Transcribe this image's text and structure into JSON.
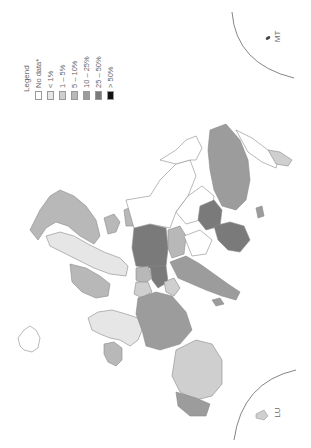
{
  "map": {
    "orientation": "rotated 90° clockwise",
    "region": "Europe",
    "legend": {
      "title": "Legend",
      "items": [
        {
          "label": "No data*",
          "color": "#ffffff"
        },
        {
          "label": "< 1%",
          "color": "#e6e6e6"
        },
        {
          "label": "1 – 5%",
          "color": "#cfcfcf"
        },
        {
          "label": "5 – 10%",
          "color": "#b8b8b8"
        },
        {
          "label": "10 – 25%",
          "color": "#9c9c9c"
        },
        {
          "label": "25 – 50%",
          "color": "#7a7a7a"
        },
        {
          "label": "> 50%",
          "color": "#111111"
        }
      ]
    },
    "insets": [
      {
        "label": "MT",
        "position": "top-right"
      },
      {
        "label": "LU",
        "position": "bottom-right"
      }
    ],
    "colors": {
      "border": "#8a8a8a",
      "inset_arc": "#666666",
      "background": "#ffffff"
    }
  }
}
